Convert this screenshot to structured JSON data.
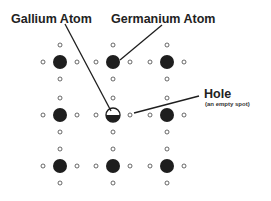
{
  "labels": {
    "gallium": "Gallium Atom",
    "germanium": "Germanium Atom",
    "hole": "Hole",
    "hole_note": "(an empty spot)"
  },
  "colors": {
    "atom": "#1e1e1e",
    "electron_stroke": "#444444",
    "line": "#1e1e1e",
    "background": "#ffffff"
  },
  "lattice": {
    "columns": [
      60,
      113,
      167
    ],
    "rows": [
      62,
      115,
      166
    ],
    "atom_radius": 7,
    "electron_radius": 2,
    "electron_offset": 17,
    "gallium_position": [
      113,
      115
    ],
    "hole_position": [
      131,
      115
    ]
  }
}
